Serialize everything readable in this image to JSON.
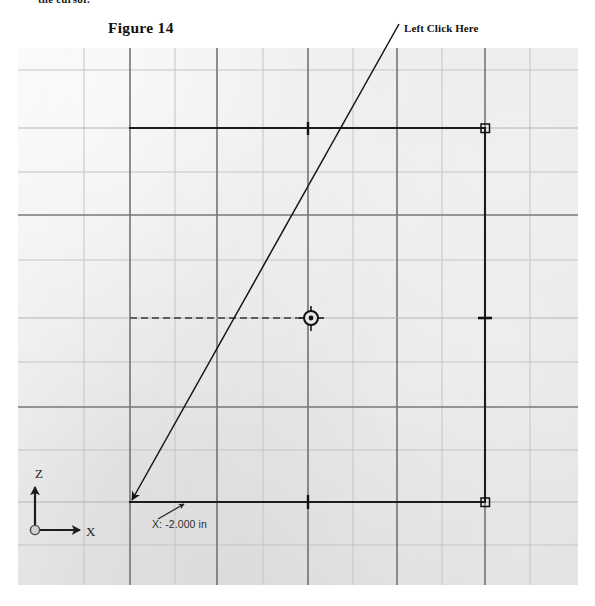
{
  "page": {
    "clipped_body_text": "the cursor.",
    "background_color": "#ffffff"
  },
  "figure": {
    "title": "Figure 14",
    "callout_label": "Left Click Here"
  },
  "viewport": {
    "background_color": "#e6e6e6",
    "bounds": {
      "x": 18,
      "y": 48,
      "width": 560,
      "height": 537
    },
    "grid": {
      "visible": true,
      "minor_color": "#c9c9c9",
      "major_color": "#6f6f6f",
      "x_lines": [
        84,
        130,
        175,
        217,
        263,
        308,
        353,
        397,
        442,
        485,
        530
      ],
      "y_lines": [
        70,
        128,
        172,
        215,
        260,
        318,
        362,
        407,
        450,
        502,
        545
      ],
      "major_x_lines": [
        130,
        217,
        308,
        397,
        485
      ],
      "major_y_lines": [
        128,
        215,
        318,
        407,
        502
      ]
    },
    "coordinate_readout": "X: -2.000 in",
    "axis_triad": {
      "z_label": "Z",
      "x_label": "X",
      "origin": {
        "x": 35,
        "y": 530
      },
      "color": "#1c1c1c"
    }
  },
  "sketch": {
    "entity_color": "#1e1e1e",
    "lines": [
      {
        "name": "top-horizontal-line",
        "x1": 130,
        "y1": 128,
        "x2": 485,
        "y2": 128,
        "midpoint_tick": true
      },
      {
        "name": "right-vertical-line",
        "x1": 485,
        "y1": 128,
        "x2": 485,
        "y2": 502,
        "midpoint_tick": true
      },
      {
        "name": "bottom-horizontal-line",
        "x1": 130,
        "y1": 502,
        "x2": 485,
        "y2": 502,
        "midpoint_tick": true
      }
    ],
    "endpoint_markers": [
      {
        "name": "endpoint-top-right",
        "x": 485,
        "y": 128
      },
      {
        "name": "endpoint-bottom-right",
        "x": 485,
        "y": 502
      }
    ],
    "center_mark": {
      "name": "center-mark",
      "x": 311,
      "y": 318
    },
    "construction_line": {
      "name": "dashed-construction-line",
      "x1": 130,
      "y1": 318,
      "x2": 304,
      "y2": 318,
      "style": "dashed"
    }
  },
  "annotations": {
    "click_leader": {
      "name": "click-leader-arrow",
      "from": {
        "x": 399,
        "y": 24
      },
      "to": {
        "x": 130,
        "y": 502
      },
      "arrowhead_at": "to"
    },
    "readout_leader": {
      "name": "readout-leader-arrow",
      "from": {
        "x": 158,
        "y": 518
      },
      "to": {
        "x": 183,
        "y": 505
      },
      "arrowhead_at": "to"
    }
  }
}
